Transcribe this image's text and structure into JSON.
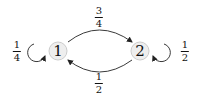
{
  "diagram": {
    "type": "markov-chain",
    "nodes": [
      {
        "id": "1",
        "label": "1",
        "cx": 58,
        "cy": 51
      },
      {
        "id": "2",
        "label": "2",
        "cx": 140,
        "cy": 51
      }
    ],
    "edges": [
      {
        "from": "1",
        "to": "2",
        "label": {
          "num": "3",
          "den": "4"
        },
        "position": "top"
      },
      {
        "from": "2",
        "to": "1",
        "label": {
          "num": "1",
          "den": "2"
        },
        "position": "bottom"
      },
      {
        "from": "1",
        "to": "1",
        "label": {
          "num": "1",
          "den": "4"
        },
        "position": "left-loop"
      },
      {
        "from": "2",
        "to": "2",
        "label": {
          "num": "1",
          "den": "2"
        },
        "position": "right-loop"
      }
    ],
    "colors": {
      "node_fill": "#eeeeee",
      "node_stroke": "#cccccc",
      "edge": "#222222"
    }
  }
}
